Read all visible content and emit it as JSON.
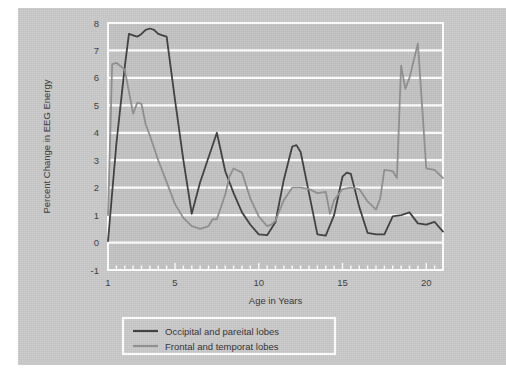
{
  "figure": {
    "background_color": "#c9c9c9",
    "plot_background_color": "#c2c2c2",
    "grid_color": "#ffffff",
    "frame_color": "#ffffff"
  },
  "chart_data": {
    "type": "line",
    "title": "",
    "xlabel": "Age in Years",
    "ylabel": "Percent Change in EEG Energy",
    "xlim": [
      1,
      21
    ],
    "ylim": [
      -1,
      8
    ],
    "xticks": [
      1,
      5,
      10,
      15,
      20
    ],
    "xtick_labels": [
      "1",
      "5",
      "10",
      "15",
      "20"
    ],
    "xminor_step": 0.5,
    "yticks": [
      -1,
      0,
      1,
      2,
      3,
      4,
      5,
      6,
      7,
      8
    ],
    "ytick_labels": [
      "-1",
      "0",
      "1",
      "2",
      "3",
      "4",
      "5",
      "6",
      "7",
      "8"
    ],
    "grid": true,
    "grid_axis": "y",
    "legend_position": "below-axes",
    "series": [
      {
        "name": "Occipital and pareital lobes",
        "color": "#3c3c3c",
        "x": [
          1.0,
          1.5,
          2.0,
          2.25,
          2.5,
          2.75,
          3.0,
          3.25,
          3.5,
          3.75,
          4.0,
          4.25,
          4.5,
          5.0,
          5.5,
          6.0,
          6.5,
          7.0,
          7.5,
          8.0,
          8.5,
          9.0,
          9.5,
          10.0,
          10.5,
          11.0,
          11.5,
          12.0,
          12.25,
          12.5,
          13.0,
          13.5,
          14.0,
          14.5,
          15.0,
          15.25,
          15.5,
          16.0,
          16.5,
          17.0,
          17.5,
          18.0,
          18.5,
          19.0,
          19.5,
          20.0,
          20.5,
          21.0
        ],
        "y": [
          0.05,
          3.6,
          6.4,
          7.6,
          7.55,
          7.5,
          7.6,
          7.75,
          7.8,
          7.75,
          7.6,
          7.55,
          7.5,
          5.2,
          3.0,
          1.05,
          2.2,
          3.1,
          4.0,
          2.6,
          1.8,
          1.1,
          0.65,
          0.3,
          0.27,
          0.75,
          2.3,
          3.5,
          3.55,
          3.3,
          1.8,
          0.3,
          0.25,
          1.0,
          2.4,
          2.55,
          2.5,
          1.3,
          0.35,
          0.3,
          0.3,
          0.95,
          1.0,
          1.1,
          0.7,
          0.65,
          0.75,
          0.4
        ]
      },
      {
        "name": "Frontal and temporat lobes",
        "color": "#8e8e8e",
        "x": [
          1.0,
          1.25,
          1.5,
          2.0,
          2.5,
          2.75,
          3.0,
          3.25,
          3.5,
          4.0,
          4.5,
          5.0,
          5.5,
          6.0,
          6.5,
          7.0,
          7.25,
          7.5,
          8.0,
          8.25,
          8.5,
          9.0,
          9.5,
          10.0,
          10.5,
          10.75,
          11.0,
          11.5,
          12.0,
          12.5,
          13.0,
          13.5,
          14.0,
          14.25,
          14.5,
          15.0,
          15.5,
          16.0,
          16.5,
          17.0,
          17.25,
          17.5,
          18.0,
          18.25,
          18.5,
          18.75,
          19.0,
          19.5,
          19.75,
          20.0,
          20.5,
          21.0
        ],
        "y": [
          1.0,
          6.5,
          6.55,
          6.3,
          4.7,
          5.1,
          5.05,
          4.3,
          3.9,
          3.0,
          2.2,
          1.4,
          0.9,
          0.6,
          0.5,
          0.6,
          0.85,
          0.85,
          1.75,
          2.4,
          2.7,
          2.55,
          1.6,
          0.95,
          0.6,
          0.65,
          0.8,
          1.55,
          2.0,
          2.0,
          1.95,
          1.8,
          1.85,
          1.05,
          1.55,
          1.95,
          2.0,
          1.95,
          1.5,
          1.2,
          1.6,
          2.65,
          2.6,
          2.35,
          6.45,
          5.6,
          6.0,
          7.25,
          5.0,
          2.7,
          2.65,
          2.35
        ]
      }
    ]
  },
  "legend": {
    "entries": [
      {
        "label": "Occipital and pareital lobes",
        "color": "#3c3c3c"
      },
      {
        "label": "Frontal and temporat lobes",
        "color": "#8e8e8e"
      }
    ]
  }
}
